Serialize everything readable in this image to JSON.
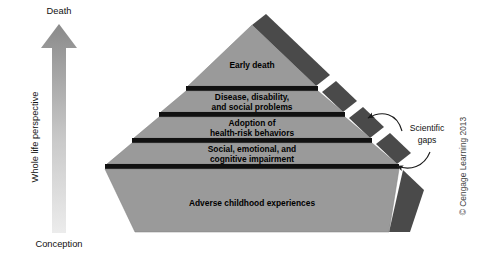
{
  "figure": {
    "background_color": "#ffffff"
  },
  "axis": {
    "top_label": "Death",
    "bottom_label": "Conception",
    "vertical_label": "Whole life perspective",
    "arrow_direction": "up",
    "arrow_color_top": "#8d8d8d",
    "arrow_color_bottom": "#e8e8e8"
  },
  "pyramid": {
    "front_face_color": "#9a9a9a",
    "side_face_color": "#4a4a4a",
    "gap_color": "#111111",
    "tiers": [
      {
        "index": 0,
        "position": "apex",
        "lines": [
          "Early death"
        ]
      },
      {
        "index": 1,
        "position": "second",
        "lines": [
          "Disease, disability,",
          "and social problems"
        ]
      },
      {
        "index": 2,
        "position": "third",
        "lines": [
          "Adoption of",
          "health-risk behaviors"
        ]
      },
      {
        "index": 3,
        "position": "fourth",
        "lines": [
          "Social, emotional, and",
          "cognitive impairment"
        ]
      },
      {
        "index": 4,
        "position": "base",
        "lines": [
          "Adverse childhood experiences"
        ]
      }
    ]
  },
  "annotations": {
    "callout": {
      "line1": "Scientific",
      "line2": "gaps",
      "arrow_count": 2
    },
    "copyright": "© Cengage Learning 2013"
  }
}
